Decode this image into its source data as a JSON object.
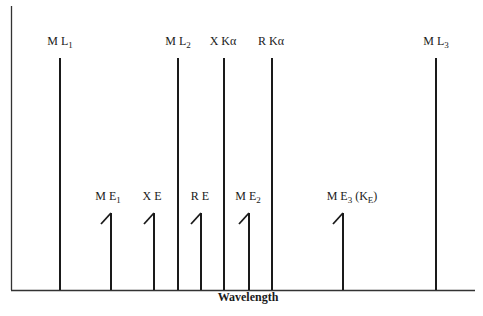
{
  "diagram": {
    "x_axis_label": "Wavelength",
    "lines": [
      {
        "id": "ML1",
        "main": "M L",
        "sub": "1",
        "suffix": "",
        "x": 60,
        "top": 58,
        "type": "line",
        "label_x": 60,
        "label_y": 42
      },
      {
        "id": "ME1",
        "main": "M E",
        "sub": "1",
        "suffix": "",
        "x": 111,
        "top": 213,
        "type": "edge",
        "label_x": 108,
        "label_y": 197
      },
      {
        "id": "XE",
        "main": "X E",
        "sub": "",
        "suffix": "",
        "x": 154,
        "top": 213,
        "type": "edge",
        "label_x": 152,
        "label_y": 197
      },
      {
        "id": "ML2",
        "main": "M L",
        "sub": "2",
        "suffix": "",
        "x": 178,
        "top": 58,
        "type": "line",
        "label_x": 178,
        "label_y": 42
      },
      {
        "id": "RE",
        "main": "R E",
        "sub": "",
        "suffix": "",
        "x": 201,
        "top": 213,
        "type": "edge",
        "label_x": 200,
        "label_y": 197
      },
      {
        "id": "XKa",
        "main": "X Kα",
        "sub": "",
        "suffix": "",
        "x": 224,
        "top": 58,
        "type": "line",
        "label_x": 223,
        "label_y": 42
      },
      {
        "id": "ME2",
        "main": "M E",
        "sub": "2",
        "suffix": "",
        "x": 249,
        "top": 213,
        "type": "edge",
        "label_x": 248,
        "label_y": 197
      },
      {
        "id": "RKa",
        "main": "R Kα",
        "sub": "",
        "suffix": "",
        "x": 272,
        "top": 58,
        "type": "line",
        "label_x": 271,
        "label_y": 42
      },
      {
        "id": "ME3",
        "main": "M E",
        "sub": "3",
        "suffix": " (K",
        "suffix_sub": "E",
        "suffix_end": ")",
        "x": 343,
        "top": 213,
        "type": "edge",
        "label_x": 352,
        "label_y": 197
      },
      {
        "id": "ML3",
        "main": "M L",
        "sub": "3",
        "suffix": "",
        "x": 436,
        "top": 58,
        "type": "line",
        "label_x": 436,
        "label_y": 42
      }
    ],
    "colors": {
      "line": "#1a1a1a",
      "axis": "#333333",
      "background": "#ffffff"
    }
  }
}
